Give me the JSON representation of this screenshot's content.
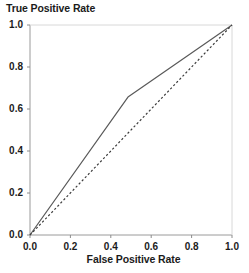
{
  "chart_data": {
    "type": "line",
    "title": "",
    "xlabel": "False Positive Rate",
    "ylabel": "True Positive Rate",
    "xlim": [
      0.0,
      1.0
    ],
    "ylim": [
      0.0,
      1.0
    ],
    "xticks": [
      "0.0",
      "0.2",
      "0.4",
      "0.6",
      "0.8",
      "1.0"
    ],
    "yticks": [
      "0.0",
      "0.2",
      "0.4",
      "0.6",
      "0.8",
      "1.0"
    ],
    "xtick_values": [
      0.0,
      0.2,
      0.4,
      0.6,
      0.8,
      1.0
    ],
    "ytick_values": [
      0.0,
      0.2,
      0.4,
      0.6,
      0.8,
      1.0
    ],
    "grid": false,
    "legend": "none",
    "series": [
      {
        "name": "ROC curve",
        "style": "solid",
        "color": "#595959",
        "x": [
          0.0,
          0.485,
          1.0
        ],
        "values": [
          0.0,
          0.657,
          1.0
        ]
      },
      {
        "name": "Chance diagonal",
        "style": "dashed",
        "color": "#3c3c3c",
        "x": [
          0.0,
          1.0
        ],
        "values": [
          0.0,
          1.0
        ]
      }
    ]
  },
  "axis": {
    "frame_color": "#9a9a9a",
    "tick_color": "#8c8c8c"
  }
}
